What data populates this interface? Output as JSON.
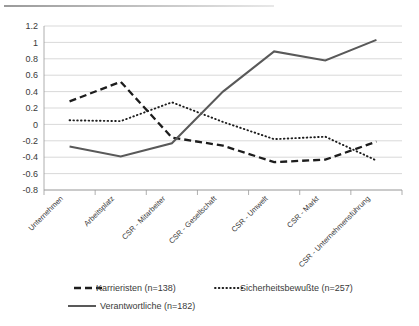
{
  "chart_data": {
    "type": "line",
    "title": "",
    "xlabel": "",
    "ylabel": "",
    "ylim": [
      -0.8,
      1.2
    ],
    "ystep": 0.2,
    "grid": true,
    "legend_position": "bottom",
    "categories": [
      "Unternehmen",
      "Arbeitsplatz",
      "CSR - Mitarbeiter",
      "CSR - Gesellschaft",
      "CSR - Umwelt",
      "CSR - Markt",
      "CSR - Unternehmensführung"
    ],
    "ytick_labels": [
      "1.2",
      "1",
      "0.8",
      "0.6",
      "0.4",
      "0.2",
      "0",
      "-0.2",
      "-0.4",
      "-0.6",
      "-0.8"
    ],
    "ytick_values": [
      1.2,
      1.0,
      0.8,
      0.6,
      0.4,
      0.2,
      0.0,
      -0.2,
      -0.4,
      -0.6,
      -0.8
    ],
    "series": [
      {
        "name": "Karrieristen (n=138)",
        "style": "dashed",
        "color": "#1d1d1d",
        "values": [
          0.28,
          0.52,
          -0.16,
          -0.26,
          -0.46,
          -0.43,
          -0.21
        ]
      },
      {
        "name": "Sicherheitsbewußte (n=257)",
        "style": "dotted",
        "color": "#1d1d1d",
        "values": [
          0.05,
          0.04,
          0.27,
          0.03,
          -0.18,
          -0.15,
          -0.44
        ]
      },
      {
        "name": "Verantwortliche (n=182)",
        "style": "solid",
        "color": "#595959",
        "values": [
          -0.27,
          -0.39,
          -0.23,
          0.4,
          0.89,
          0.78,
          1.03
        ]
      }
    ]
  },
  "legend": {
    "items": [
      {
        "label": "Karrieristen (n=138)",
        "style": "dashed"
      },
      {
        "label": "Sicherheitsbewußte (n=257)",
        "style": "dotted"
      },
      {
        "label": "Verantwortliche (n=182)",
        "style": "solid"
      }
    ]
  }
}
